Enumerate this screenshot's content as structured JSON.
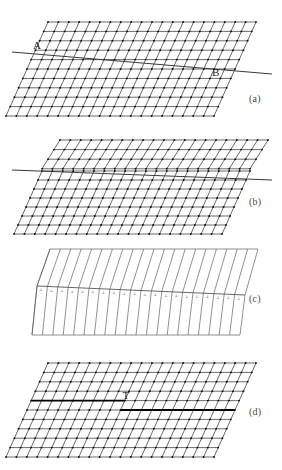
{
  "figure": {
    "background_color": "#ffffff",
    "line_color": "#2b2b2b",
    "node_color": "#111111",
    "accent_color": "#000000",
    "width": 282,
    "height": 470
  },
  "panels": [
    {
      "id": "a",
      "label": "(a)",
      "kind": "lattice",
      "description": "Sheared parallelogram lattice with node dots and a straight slip trace line A-B crossing it",
      "columns": 20,
      "rows": 10,
      "shear": "right-leaning uniform",
      "annotations": [
        {
          "name": "point-a",
          "text": "A",
          "x": 33,
          "y": 39
        },
        {
          "name": "point-b",
          "text": "B",
          "x": 212,
          "y": 66
        }
      ],
      "slip_line": {
        "x1": 12,
        "y1": 52,
        "x2": 272,
        "y2": 74
      }
    },
    {
      "id": "b",
      "label": "(b)",
      "kind": "lattice-dislocated",
      "description": "Lattice after slip; upper block sheared more steeply than lower block, separated by a horizontal slip plane",
      "columns": 20,
      "rows_upper": 3,
      "rows_lower": 7,
      "shear": "two-zone mismatched",
      "slip_line": {
        "x1": 12,
        "y1": 170,
        "x2": 272,
        "y2": 180
      }
    },
    {
      "id": "c",
      "label": "(c)",
      "kind": "chevron",
      "description": "Schematic chevron/herringbone of lattice planes only, with inverted-T dislocation symbols along the slip plane",
      "columns": 20,
      "dislocation_symbol": "⊥",
      "dislocation_count": 20,
      "slip_line": {
        "x1": 38,
        "y1": 285,
        "x2": 246,
        "y2": 296
      }
    },
    {
      "id": "d",
      "label": "(d)",
      "kind": "lattice-edge-dislocation",
      "description": "Final lattice containing a single edge dislocation marked with a large T symbol on a stepped bold slip line",
      "columns": 20,
      "rows": 10,
      "annotations": [
        {
          "name": "dislocation-symbol",
          "text": "T",
          "x": 138,
          "y": 398
        }
      ]
    }
  ]
}
